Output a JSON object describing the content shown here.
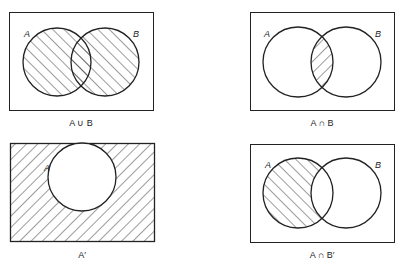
{
  "colors": {
    "ink": "#222222",
    "background": "#ffffff"
  },
  "diagrams": [
    {
      "id": "union",
      "caption": "A ∪ B",
      "labels": [
        "A",
        "B"
      ],
      "shaded": "A or B"
    },
    {
      "id": "intersection",
      "caption": "A ∩ B",
      "labels": [
        "A",
        "B"
      ],
      "shaded": "A and B"
    },
    {
      "id": "complement",
      "caption": "A′",
      "labels": [
        "A"
      ],
      "shaded": "outside A"
    },
    {
      "id": "difference",
      "caption": "A ∩ B′",
      "labels": [
        "A",
        "B"
      ],
      "shaded": "A not B"
    }
  ]
}
